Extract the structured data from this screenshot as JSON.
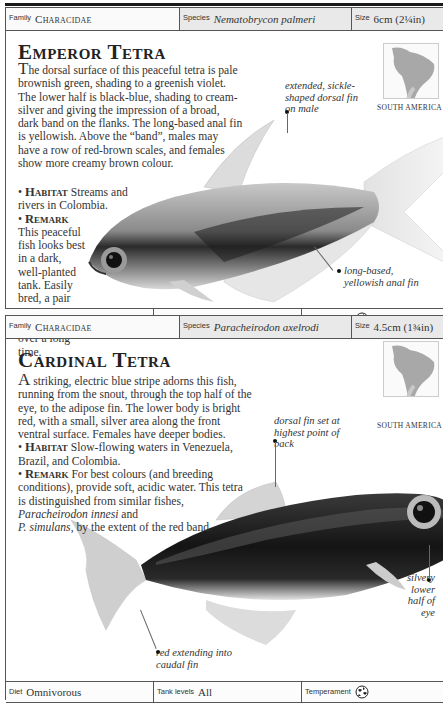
{
  "entries": [
    {
      "header": {
        "family_label": "Family",
        "family_value": "Characidae",
        "species_label": "Species",
        "species_value": "Nematobrycon palmeri",
        "size_label": "Size",
        "size_value": "6cm (2¼in)"
      },
      "title": "Emperor Tetra",
      "description": {
        "dropcap": "T",
        "body": "he dorsal surface of this peaceful tetra is pale brownish green, shading to a greenish violet. The lower half is black-blue, shading to cream-silver and giving the impression of a broad, dark band on the flanks. The long-based anal fin is yellowish. Above the “band”, males may have a row of red-brown scales, and females show more creamy brown colour.",
        "habitat_label": "Habitat",
        "habitat_text": "Streams and rivers in Colombia.",
        "remark_label": "Remark",
        "remark_text": "This peaceful fish looks best in a dark, well-planted tank. Easily bred, a pair may spawn a few eggs daily over a long time."
      },
      "map_caption": "SOUTH AMERICA",
      "annotations": [
        "extended, sickle-shaped dorsal fin on male",
        "long-based, yellowish anal fin"
      ],
      "footer": {
        "diet_label": "Diet",
        "diet_value": "Omnivorous",
        "tank_label": "Tank levels",
        "tank_value": "All",
        "temperament_label": "Temperament",
        "temperament_icon": "peaceful-fish-icon"
      }
    },
    {
      "header": {
        "family_label": "Family",
        "family_value": "Characidae",
        "species_label": "Species",
        "species_value": "Paracheirodon axelrodi",
        "size_label": "Size",
        "size_value": "4.5cm (1¾in)"
      },
      "title": "Cardinal Tetra",
      "description": {
        "dropcap": "A",
        "body": " striking, electric blue stripe adorns this fish, running from the snout, through the top half of the eye, to the adipose fin. The lower body is bright red, with a small, silver area along the front ventral surface. Females have deeper bodies.",
        "habitat_label": "Habitat",
        "habitat_text": "Slow-flowing waters in Venezuela, Brazil, and Colombia.",
        "remark_label": "Remark",
        "remark_text_1": "For best colours (and breeding conditions), provide soft, acidic water. This tetra is distinguished from similar fishes,",
        "remark_italic_1": "Paracheirodon innesi",
        "remark_text_2": "and",
        "remark_italic_2": "P. simulans",
        "remark_text_3": ", by the extent of the red band."
      },
      "map_caption": "SOUTH AMERICA",
      "annotations": [
        "dorsal fin set at highest point of back",
        "silvery lower half of eye",
        "red extending into caudal fin"
      ],
      "footer": {
        "diet_label": "Diet",
        "diet_value": "Omnivorous",
        "tank_label": "Tank levels",
        "tank_value": "All",
        "temperament_label": "Temperament",
        "temperament_icon": "peaceful-fish-icon"
      }
    }
  ]
}
